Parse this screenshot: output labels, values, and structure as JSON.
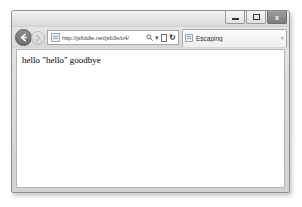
{
  "window": {
    "controls": {
      "minimize_label": "Minimize",
      "maximize_label": "Maximize",
      "close_label": "x"
    }
  },
  "toolbar": {
    "back_label": "←",
    "forward_label": "→",
    "back_icon": "back-arrow-icon",
    "forward_icon": "forward-arrow-icon"
  },
  "address": {
    "url": "http://jsfiddle.net/jsb3e/o4/",
    "placeholder": "Search or enter address",
    "search_icon": "magnifier-icon",
    "dropdown_icon": "▾",
    "compat_icon": "compatibility-view-icon",
    "refresh_icon": "↻"
  },
  "tabs": [
    {
      "title": "Escaping",
      "close_label": "×",
      "favicon": "page-favicon-icon",
      "active": true
    }
  ],
  "page": {
    "body_text": "hello \"hello\" goodbye"
  },
  "colors": {
    "chrome": "#d9d9d9",
    "viewport": "#ffffff",
    "border": "#8e8e8e",
    "text": "#000000"
  }
}
